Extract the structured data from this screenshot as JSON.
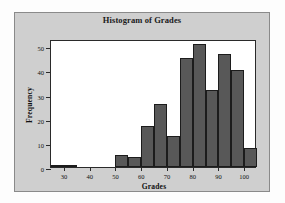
{
  "figure": {
    "background": "#fdfdfd",
    "panel_color": "#cfcfcf",
    "plot_background": "#ffffff",
    "bar_color": "#585858",
    "bar_edge_color": "#1c1c1c",
    "axis_color": "#2a2a2a"
  },
  "chart_data": {
    "type": "bar",
    "title": "Histogram of Grades",
    "xlabel": "Grades",
    "ylabel": "Frequency",
    "xlim": [
      25,
      105
    ],
    "ylim": [
      0,
      53
    ],
    "bin_width": 5,
    "grid": false,
    "legend": null,
    "xticks": [
      30,
      40,
      50,
      60,
      70,
      80,
      90,
      100
    ],
    "xtick_labels": [
      "30",
      "40",
      "50",
      "60",
      "70",
      "80",
      "90",
      "100"
    ],
    "yticks": [
      0,
      10,
      20,
      30,
      40,
      50
    ],
    "ytick_labels": [
      "0",
      "10",
      "20",
      "30",
      "40",
      "50"
    ],
    "bins": [
      {
        "start": 25,
        "end": 30,
        "label": "25-30",
        "value": 1
      },
      {
        "start": 30,
        "end": 35,
        "label": "30-35",
        "value": 1
      },
      {
        "start": 35,
        "end": 40,
        "label": "35-40",
        "value": 0
      },
      {
        "start": 40,
        "end": 45,
        "label": "40-45",
        "value": 0
      },
      {
        "start": 45,
        "end": 50,
        "label": "45-50",
        "value": 0
      },
      {
        "start": 50,
        "end": 55,
        "label": "50-55",
        "value": 5
      },
      {
        "start": 55,
        "end": 60,
        "label": "55-60",
        "value": 4
      },
      {
        "start": 60,
        "end": 65,
        "label": "60-65",
        "value": 17
      },
      {
        "start": 65,
        "end": 70,
        "label": "65-70",
        "value": 26
      },
      {
        "start": 70,
        "end": 75,
        "label": "70-75",
        "value": 13
      },
      {
        "start": 75,
        "end": 80,
        "label": "75-80",
        "value": 45
      },
      {
        "start": 80,
        "end": 85,
        "label": "80-85",
        "value": 51
      },
      {
        "start": 85,
        "end": 90,
        "label": "85-90",
        "value": 32
      },
      {
        "start": 90,
        "end": 95,
        "label": "90-95",
        "value": 47
      },
      {
        "start": 95,
        "end": 100,
        "label": "95-100",
        "value": 40
      },
      {
        "start": 100,
        "end": 105,
        "label": "100-105",
        "value": 8
      }
    ],
    "categories": [
      "25-30",
      "30-35",
      "35-40",
      "40-45",
      "45-50",
      "50-55",
      "55-60",
      "60-65",
      "65-70",
      "70-75",
      "75-80",
      "80-85",
      "85-90",
      "90-95",
      "95-100",
      "100-105"
    ],
    "values": [
      1,
      1,
      0,
      0,
      0,
      5,
      4,
      17,
      26,
      13,
      45,
      51,
      32,
      47,
      40,
      8
    ]
  }
}
